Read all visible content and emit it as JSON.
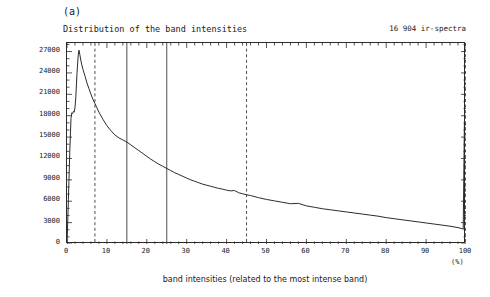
{
  "figure": {
    "panel_label": "(a)",
    "title": "Distribution of the band intensities",
    "corner_note": "16 904 ir-spectra",
    "xlabel": "band intensities (related to the most intense band)",
    "xunit": "(%)",
    "ylabel": "number of bands"
  },
  "chart_data": {
    "type": "line",
    "title": "Distribution of the band intensities",
    "subtitle": "16 904 ir-spectra",
    "xlabel": "band intensities (related to the most intense band)",
    "xunit": "(%)",
    "ylabel": "number of bands",
    "xlim": [
      0,
      100
    ],
    "ylim": [
      0,
      28200
    ],
    "xticks": [
      0,
      10,
      20,
      30,
      40,
      50,
      60,
      70,
      80,
      90,
      100
    ],
    "xtick_labels": [
      "0",
      "10",
      "20",
      "30",
      "40",
      "50",
      "60",
      "70",
      "80",
      "90",
      "100"
    ],
    "xminor_step": 2,
    "yticks": [
      0,
      3000,
      6000,
      9000,
      12000,
      15000,
      18000,
      21000,
      24000,
      27000
    ],
    "ytick_labels": [
      "0",
      "3000",
      "6000",
      "9000",
      "12000",
      "15000",
      "18000",
      "21000",
      "24000",
      "27000"
    ],
    "grid": false,
    "legend": "none",
    "line_color": "#2b2b2b",
    "vline_color": "#3a3a3a",
    "vlines": [
      {
        "x": 7,
        "style": "dashed"
      },
      {
        "x": 15,
        "style": "solid"
      },
      {
        "x": 25,
        "style": "solid"
      },
      {
        "x": 45,
        "style": "dashed"
      },
      {
        "x": 100,
        "style": "dashed"
      }
    ],
    "series": [
      {
        "name": "number of bands",
        "x": [
          0.0,
          0.35,
          0.7,
          1.0,
          1.2,
          1.4,
          1.6,
          1.8,
          2.0,
          2.2,
          2.5,
          2.8,
          3.0,
          3.2,
          3.6,
          4.0,
          4.5,
          5.0,
          5.5,
          6.0,
          6.5,
          7.0,
          7.5,
          8.0,
          9.0,
          10.0,
          11.0,
          12.0,
          13.0,
          14.0,
          15.0,
          16.0,
          17.0,
          18.0,
          19.0,
          20.0,
          21.0,
          22.0,
          23.0,
          24.0,
          25.0,
          26.0,
          27.0,
          28.0,
          29.0,
          30.0,
          31.0,
          32.0,
          33.0,
          34.0,
          35.0,
          36.0,
          37.0,
          38.0,
          39.0,
          40.0,
          41.0,
          42.0,
          43.0,
          44.0,
          45.0,
          46.0,
          48.0,
          50.0,
          52.0,
          54.0,
          56.0,
          58.0,
          60.0,
          62.0,
          64.0,
          66.0,
          68.0,
          70.0,
          72.0,
          74.0,
          76.0,
          78.0,
          80.0,
          82.0,
          84.0,
          86.0,
          88.0,
          90.0,
          92.0,
          94.0,
          96.0,
          98.0,
          99.0,
          99.3,
          99.6,
          100.0
        ],
        "y": [
          0,
          6200,
          13000,
          17600,
          18400,
          18300,
          18600,
          18500,
          19100,
          20500,
          23900,
          26400,
          27200,
          26600,
          25400,
          24500,
          23600,
          22600,
          21800,
          21000,
          20300,
          19700,
          19100,
          18500,
          17500,
          16600,
          15900,
          15300,
          14900,
          14600,
          14300,
          13900,
          13500,
          13100,
          12700,
          12300,
          11900,
          11550,
          11200,
          10900,
          10600,
          10300,
          10000,
          9750,
          9500,
          9250,
          9000,
          8800,
          8600,
          8400,
          8250,
          8100,
          7950,
          7800,
          7700,
          7550,
          7450,
          7500,
          7200,
          7050,
          6900,
          6800,
          6500,
          6250,
          6050,
          5850,
          5650,
          5700,
          5350,
          5150,
          4950,
          4800,
          4650,
          4500,
          4350,
          4200,
          4050,
          3900,
          3700,
          3550,
          3400,
          3250,
          3100,
          2950,
          2800,
          2650,
          2500,
          2300,
          2150,
          2100,
          17000,
          16600
        ]
      }
    ]
  }
}
